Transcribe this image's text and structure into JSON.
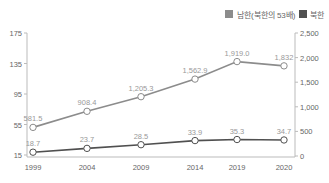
{
  "chart_data": {
    "type": "line",
    "title": "",
    "categories": [
      "1999",
      "2004",
      "2009",
      "2014",
      "2019",
      "2020"
    ],
    "series": [
      {
        "name": "남한(북한의 53배)",
        "axis": "right",
        "values": [
          581.5,
          908.4,
          1205.3,
          1562.9,
          1919.0,
          1832
        ],
        "labels": [
          "581.5",
          "908.4",
          "1,205.3",
          "1,562.9",
          "1,919.0",
          "1,832"
        ],
        "color": "#8c8c8c"
      },
      {
        "name": "북한",
        "axis": "left",
        "values": [
          18.7,
          23.7,
          28.5,
          33.9,
          35.3,
          34.7
        ],
        "labels": [
          "18.7",
          "23.7",
          "28.5",
          "33.9",
          "35.3",
          "34.7"
        ],
        "color": "#505050"
      }
    ],
    "left_axis": {
      "ticks": [
        "175",
        "135",
        "95",
        "55",
        "15"
      ],
      "ylim": [
        15,
        175
      ]
    },
    "right_axis": {
      "ticks": [
        "2,500",
        "2,000",
        "1,500",
        "1,000",
        "500",
        "0"
      ],
      "ylim": [
        0,
        2500
      ]
    },
    "legend_position": "top-right",
    "grid": false
  },
  "legend": {
    "items": [
      {
        "label": "남한(북한의 53배)",
        "color": "#8c8c8c"
      },
      {
        "label": "북한",
        "color": "#505050"
      }
    ]
  }
}
